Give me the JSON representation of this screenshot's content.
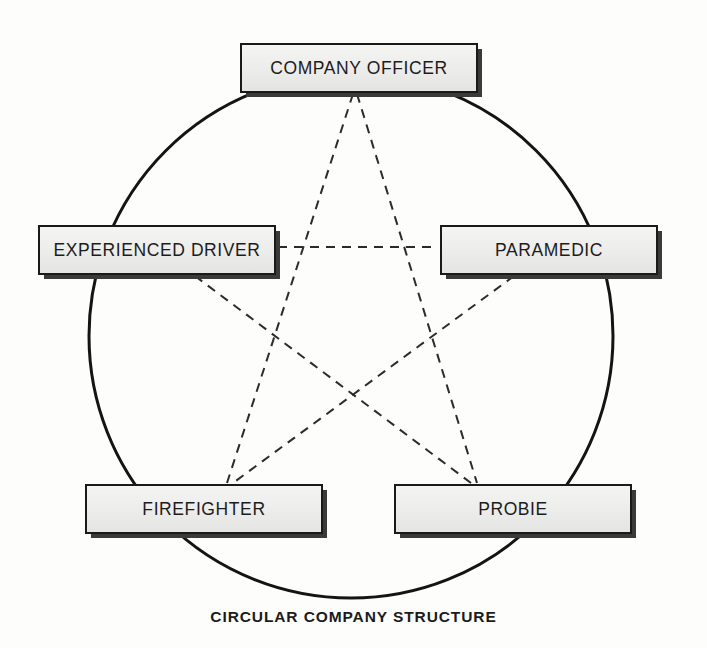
{
  "diagram": {
    "caption": "CIRCULAR COMPANY STRUCTURE",
    "type": "circular-network-diagram",
    "background_color": "#fdfdfc",
    "node_fill_color": "#ececeb",
    "node_border_color": "#1a1a1a",
    "node_shadow_color": "#3a3a3a",
    "circle": {
      "name": "outer-circle",
      "center_x": 351,
      "center_y": 336,
      "radius_x": 262,
      "radius_y": 262,
      "stroke_color": "#141414",
      "stroke_width": 3,
      "style": "solid"
    },
    "connector_style": {
      "name": "pentagram-dashed-links",
      "stroke_color": "#2b2b2b",
      "stroke_width": 2,
      "dash": "9 7",
      "style": "dashed"
    },
    "nodes": [
      {
        "id": "company-officer",
        "label": "COMPANY OFFICER",
        "x": 240,
        "y": 43,
        "width": 238,
        "height": 50
      },
      {
        "id": "experienced-driver",
        "label": "EXPERIENCED DRIVER",
        "x": 38,
        "y": 225,
        "width": 238,
        "height": 50
      },
      {
        "id": "paramedic",
        "label": "PARAMEDIC",
        "x": 440,
        "y": 225,
        "width": 218,
        "height": 50
      },
      {
        "id": "firefighter",
        "label": "FIREFIGHTER",
        "x": 85,
        "y": 484,
        "width": 238,
        "height": 50
      },
      {
        "id": "probie",
        "label": "PROBIE",
        "x": 394,
        "y": 484,
        "width": 238,
        "height": 50
      }
    ],
    "links": [
      {
        "id": "link-officer-firefighter",
        "from": "company-officer",
        "to": "firefighter",
        "x1": 353,
        "y1": 94,
        "x2": 227,
        "y2": 483
      },
      {
        "id": "link-officer-probie",
        "from": "company-officer",
        "to": "probie",
        "x1": 357,
        "y1": 94,
        "x2": 477,
        "y2": 483
      },
      {
        "id": "link-driver-paramedic",
        "from": "experienced-driver",
        "to": "paramedic",
        "x1": 278,
        "y1": 247,
        "x2": 438,
        "y2": 247
      },
      {
        "id": "link-driver-probie",
        "from": "experienced-driver",
        "to": "probie",
        "x1": 195,
        "y1": 276,
        "x2": 471,
        "y2": 483
      },
      {
        "id": "link-paramedic-firefighter",
        "from": "paramedic",
        "to": "firefighter",
        "x1": 514,
        "y1": 276,
        "x2": 233,
        "y2": 483
      }
    ]
  }
}
